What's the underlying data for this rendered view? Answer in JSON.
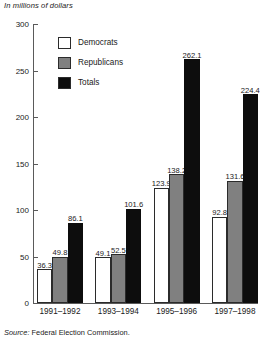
{
  "figure": {
    "unit_caption": "In millions of dollars",
    "source_lead": "Source:",
    "source_text": "Federal Election Commission."
  },
  "legend": {
    "items": [
      {
        "label": "Democrats",
        "color": "#ffffff",
        "swatch": "legend-swatch-democrats"
      },
      {
        "label": "Republicans",
        "color": "#808080",
        "swatch": "legend-swatch-republicans"
      },
      {
        "label": "Totals",
        "color": "#0d0d0d",
        "swatch": "legend-swatch-totals"
      }
    ]
  },
  "axis": {
    "y_ticks": [
      "300",
      "250",
      "200",
      "150",
      "100",
      "50",
      "0"
    ]
  },
  "chart_data": {
    "type": "bar",
    "title": "",
    "subtitle": "",
    "xlabel": "",
    "ylabel": "In millions of dollars",
    "ylim": [
      0,
      300
    ],
    "ytick_values": [
      0,
      50,
      100,
      150,
      200,
      250,
      300
    ],
    "grid": false,
    "legend_position": "inside-upper-left",
    "categories": [
      "1991–1992",
      "1993–1994",
      "1995–1996",
      "1997–1998"
    ],
    "series": [
      {
        "name": "Democrats",
        "color": "#ffffff",
        "values": [
          36.3,
          49.1,
          123.9,
          92.8
        ]
      },
      {
        "name": "Republicans",
        "color": "#808080",
        "values": [
          49.8,
          52.5,
          138.2,
          131.6
        ]
      },
      {
        "name": "Totals",
        "color": "#0d0d0d",
        "values": [
          86.1,
          101.6,
          262.1,
          224.4
        ]
      }
    ],
    "data_labels": [
      [
        "36.3",
        "49.8",
        "86.1"
      ],
      [
        "49.1",
        "52.5",
        "101.6"
      ],
      [
        "123.9",
        "138.2",
        "262.1"
      ],
      [
        "92.8",
        "131.6",
        "224.4"
      ]
    ],
    "source": "Source: Federal Election Commission."
  }
}
